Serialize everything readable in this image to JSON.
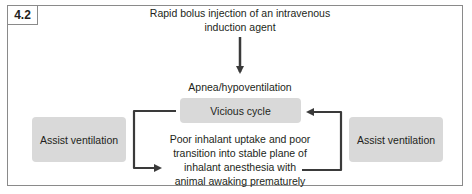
{
  "figure": {
    "label": "4.2",
    "nodes": {
      "trigger": "Rapid bolus injection of an intravenous induction agent",
      "trigger_lines": [
        "Rapid bolus injection of an intravenous",
        "induction agent"
      ],
      "effect": "Apnea/hypoventilation",
      "cycle": "Vicious cycle",
      "consequence_lines": [
        "Poor inhalant uptake and poor",
        "transition into stable plane of",
        "inhalant anesthesia with",
        "animal awaking prematurely"
      ],
      "assist_left": "Assist ventilation",
      "assist_right": "Assist ventilation"
    },
    "colors": {
      "box_fill": "#d9d9d9",
      "arrow": "#3a3a3a",
      "border": "#8a8a8a",
      "text": "#231f20"
    }
  }
}
